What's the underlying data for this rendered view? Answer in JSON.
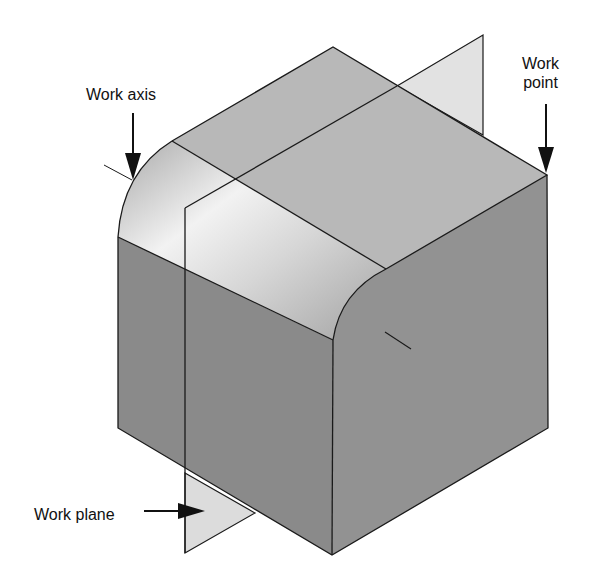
{
  "figure": {
    "type": "isometric CAD model illustration",
    "labels": {
      "work_axis": "Work axis",
      "work_point_line1": "Work",
      "work_point_line2": "point",
      "work_plane": "Work plane"
    },
    "colors": {
      "background": "#ffffff",
      "top_face": "#b9b9b9",
      "fillet_highlight": "#efefef",
      "fillet_shadow": "#a8a8a8",
      "left_face": "#8c8c8c",
      "right_face": "#919191",
      "work_plane": "#dedede",
      "edge": "#1a1a1a"
    }
  }
}
